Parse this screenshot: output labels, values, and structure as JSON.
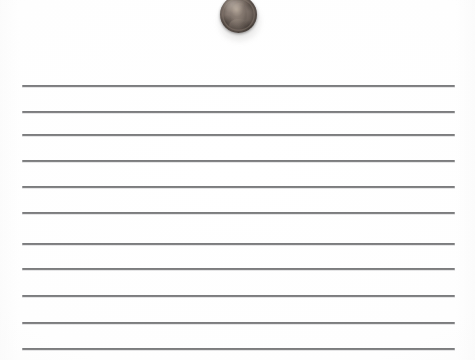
{
  "scene": {
    "description": "Lincoln one-cent coin resting on a sheet of ruled notebook paper",
    "width": 475,
    "height": 360,
    "background_color": "#fdfdfd"
  },
  "paper": {
    "name": "ruled-paper-sheet",
    "paper_color": "#fdfdfd",
    "rule_color": "#4c4d4f",
    "rule_count": 11,
    "rule_left_x": 22,
    "rule_right_x": 455,
    "rule_thickness": 2,
    "rules": [
      {
        "index": 1,
        "y": 85
      },
      {
        "index": 2,
        "y": 111
      },
      {
        "index": 3,
        "y": 134
      },
      {
        "index": 4,
        "y": 160
      },
      {
        "index": 5,
        "y": 186
      },
      {
        "index": 6,
        "y": 212
      },
      {
        "index": 7,
        "y": 243
      },
      {
        "index": 8,
        "y": 268
      },
      {
        "index": 9,
        "y": 295
      },
      {
        "index": 10,
        "y": 322
      },
      {
        "index": 11,
        "y": 348
      }
    ]
  },
  "coin": {
    "name": "lincoln-penny",
    "denomination": "one cent",
    "obverse_subject": "Abraham Lincoln profile",
    "metal_color": "#6b6059",
    "highlight_color": "#9a8e84",
    "shadow_color": "#352f2c",
    "x": 220,
    "y": -4,
    "diameter": 37,
    "cropped_at_top_edge": true
  }
}
